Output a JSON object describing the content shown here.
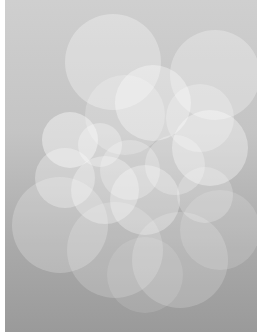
{
  "image": {
    "description": "Abstract bokeh of overlapping translucent white circles on a gray vertical gradient",
    "background": {
      "top": "#cfcfcf",
      "bottom": "#9a9a9a"
    },
    "circles": [
      {
        "cx": 108,
        "cy": 62,
        "r": 48,
        "a": 0.3
      },
      {
        "cx": 210,
        "cy": 75,
        "r": 45,
        "a": 0.28
      },
      {
        "cx": 148,
        "cy": 103,
        "r": 38,
        "a": 0.35
      },
      {
        "cx": 120,
        "cy": 115,
        "r": 40,
        "a": 0.22
      },
      {
        "cx": 195,
        "cy": 118,
        "r": 34,
        "a": 0.25
      },
      {
        "cx": 65,
        "cy": 140,
        "r": 28,
        "a": 0.4
      },
      {
        "cx": 95,
        "cy": 145,
        "r": 22,
        "a": 0.3
      },
      {
        "cx": 205,
        "cy": 148,
        "r": 38,
        "a": 0.35
      },
      {
        "cx": 170,
        "cy": 165,
        "r": 30,
        "a": 0.25
      },
      {
        "cx": 125,
        "cy": 170,
        "r": 30,
        "a": 0.25
      },
      {
        "cx": 60,
        "cy": 178,
        "r": 30,
        "a": 0.3
      },
      {
        "cx": 100,
        "cy": 190,
        "r": 34,
        "a": 0.3
      },
      {
        "cx": 140,
        "cy": 200,
        "r": 35,
        "a": 0.3
      },
      {
        "cx": 200,
        "cy": 195,
        "r": 28,
        "a": 0.22
      },
      {
        "cx": 55,
        "cy": 225,
        "r": 48,
        "a": 0.22
      },
      {
        "cx": 110,
        "cy": 250,
        "r": 48,
        "a": 0.18
      },
      {
        "cx": 175,
        "cy": 260,
        "r": 48,
        "a": 0.18
      },
      {
        "cx": 215,
        "cy": 230,
        "r": 40,
        "a": 0.15
      },
      {
        "cx": 140,
        "cy": 275,
        "r": 38,
        "a": 0.12
      }
    ]
  }
}
